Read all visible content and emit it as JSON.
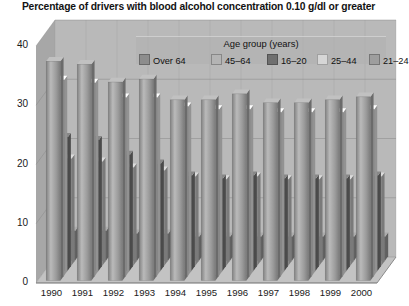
{
  "title": "Percentage of drivers with blood alcohol concentration 0.10 g/dl or greater",
  "legend": {
    "title": "Age group (years)",
    "items": [
      {
        "label": "Over 64",
        "color": "#8d8d8d"
      },
      {
        "label": "45–64",
        "color": "#b4b4b4"
      },
      {
        "label": "16–20",
        "color": "#6f6f6f"
      },
      {
        "label": "25–44",
        "color": "#d6d6d6"
      },
      {
        "label": "21–24",
        "color": "#9e9e9e"
      }
    ]
  },
  "axes": {
    "y_ticks": [
      "40",
      "30",
      "20",
      "10",
      "0"
    ],
    "x_ticks": [
      "1990",
      "1991",
      "1992",
      "1993",
      "1994",
      "1995",
      "1996",
      "1997",
      "1998",
      "1999",
      "2000"
    ]
  },
  "chart_data": {
    "type": "bar",
    "title": "Percentage of drivers with blood alcohol concentration 0.10 g/dl or greater",
    "xlabel": "",
    "ylabel": "Percentage",
    "ylim": [
      0,
      40
    ],
    "grid": true,
    "legend_position": "top-right",
    "legend_title": "Age group (years)",
    "categories": [
      "1990",
      "1991",
      "1992",
      "1993",
      "1994",
      "1995",
      "1996",
      "1997",
      "1998",
      "1999",
      "2000"
    ],
    "series": [
      {
        "name": "21–24",
        "color": "#9e9e9e",
        "values": [
          37.0,
          36.5,
          33.5,
          34.0,
          30.5,
          30.5,
          31.5,
          30.0,
          30.0,
          30.5,
          31.0
        ]
      },
      {
        "name": "25–44",
        "color": "#d6d6d6",
        "values": [
          33.0,
          32.5,
          30.0,
          30.0,
          28.5,
          28.0,
          28.0,
          27.5,
          27.5,
          27.5,
          28.0
        ]
      },
      {
        "name": "16–20",
        "color": "#6f6f6f",
        "values": [
          22.5,
          22.0,
          19.5,
          18.0,
          16.0,
          15.5,
          16.0,
          15.5,
          15.5,
          15.5,
          16.0
        ]
      },
      {
        "name": "45–64",
        "color": "#b4b4b4",
        "values": [
          18.0,
          17.5,
          16.5,
          16.0,
          15.0,
          14.5,
          15.0,
          14.5,
          14.5,
          14.5,
          15.0
        ]
      },
      {
        "name": "Over 64",
        "color": "#8d8d8d",
        "values": [
          5.0,
          5.0,
          4.5,
          4.5,
          4.0,
          4.0,
          4.0,
          4.0,
          4.0,
          4.0,
          4.0
        ]
      }
    ]
  }
}
